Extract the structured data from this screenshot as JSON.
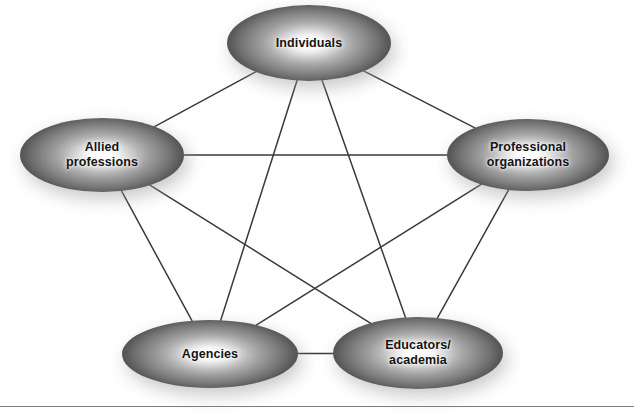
{
  "figure": {
    "background_color": "#ffffff",
    "edge_color": "#3a3a3a",
    "node_text_color": "#141414",
    "node_gradient": {
      "center": "#ffffff",
      "mid": "#a8a8a8",
      "edge": "#4e4e4e"
    }
  },
  "nodes": [
    {
      "id": "individuals",
      "label": "Individuals",
      "cx": 309,
      "cy": 43,
      "rx": 82,
      "ry": 38
    },
    {
      "id": "allied-professions",
      "label": "Allied\nprofessions",
      "cx": 102,
      "cy": 155,
      "rx": 82,
      "ry": 37
    },
    {
      "id": "professional-organizations",
      "label": "Professional\norganizations",
      "cx": 528,
      "cy": 155,
      "rx": 81,
      "ry": 36
    },
    {
      "id": "agencies",
      "label": "Agencies",
      "cx": 210,
      "cy": 354,
      "rx": 88,
      "ry": 34
    },
    {
      "id": "educators-academia",
      "label": "Educators/\nacademia",
      "cx": 418,
      "cy": 353,
      "rx": 85,
      "ry": 36
    }
  ],
  "edges": [
    {
      "from": "individuals",
      "to": "allied-professions"
    },
    {
      "from": "individuals",
      "to": "professional-organizations"
    },
    {
      "from": "individuals",
      "to": "agencies"
    },
    {
      "from": "individuals",
      "to": "educators-academia"
    },
    {
      "from": "allied-professions",
      "to": "professional-organizations"
    },
    {
      "from": "allied-professions",
      "to": "agencies"
    },
    {
      "from": "allied-professions",
      "to": "educators-academia"
    },
    {
      "from": "professional-organizations",
      "to": "agencies"
    },
    {
      "from": "professional-organizations",
      "to": "educators-academia"
    },
    {
      "from": "agencies",
      "to": "educators-academia"
    }
  ],
  "footer": {
    "caption": ""
  }
}
